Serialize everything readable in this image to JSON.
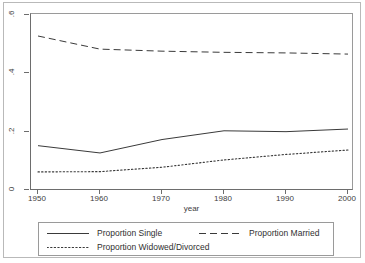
{
  "chart_data": {
    "type": "line",
    "title": "",
    "subtitle": "",
    "xlabel": "year",
    "ylabel": "",
    "x": [
      1950,
      1960,
      1970,
      1980,
      1990,
      2000
    ],
    "xlim": [
      1950,
      2000
    ],
    "ylim": [
      0,
      0.6
    ],
    "xticks": [
      "1950",
      "1960",
      "1970",
      "1980",
      "1990",
      "2000"
    ],
    "yticks": [
      "0",
      ".2",
      ".4",
      ".6"
    ],
    "ytick_values": [
      0,
      0.2,
      0.4,
      0.6
    ],
    "grid": false,
    "legend_position": "bottom",
    "series": [
      {
        "name": "Proportion Single",
        "style": "solid",
        "color": "#3a3a3a",
        "values": [
          0.152,
          0.127,
          0.173,
          0.203,
          0.2,
          0.209
        ]
      },
      {
        "name": "Proportion Married",
        "style": "dashed",
        "color": "#3a3a3a",
        "values": [
          0.528,
          0.483,
          0.476,
          0.472,
          0.47,
          0.466
        ]
      },
      {
        "name": "Proportion Widowed/Divorced",
        "style": "dotted",
        "color": "#3a3a3a",
        "values": [
          0.062,
          0.063,
          0.078,
          0.103,
          0.122,
          0.137
        ]
      }
    ]
  },
  "legend": {
    "entries": [
      {
        "label": "Proportion Single"
      },
      {
        "label": "Proportion Married"
      },
      {
        "label": "Proportion Widowed/Divorced"
      }
    ]
  },
  "axes": {
    "x_title": "year"
  }
}
